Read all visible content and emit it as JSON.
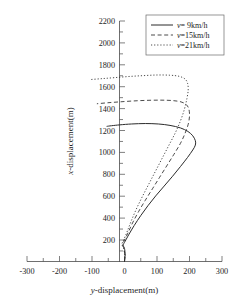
{
  "chart_data": {
    "type": "line",
    "title": "",
    "xlabel": "y-displacement(m)",
    "ylabel": "x-displacement(m)",
    "xlim": [
      -300,
      300
    ],
    "ylim": [
      0,
      2200
    ],
    "xticks": [
      -300,
      -200,
      -100,
      0,
      100,
      200,
      300
    ],
    "yticks": [
      200,
      400,
      600,
      800,
      1000,
      1200,
      1400,
      1600,
      1800,
      2000,
      2200
    ],
    "xtick_labels": [
      "-300",
      "-200",
      "-100",
      "0",
      "100",
      "200",
      "300"
    ],
    "ytick_labels": [
      "200",
      "400",
      "600",
      "800",
      "1000",
      "1200",
      "1400",
      "1600",
      "1800",
      "2000",
      "2200"
    ],
    "x_minor_tick_step": 50,
    "y_minor_tick_step": 100,
    "grid": false,
    "legend_position": "top-right",
    "series": [
      {
        "name": "v= 9km/h",
        "style": "solid",
        "color": "#2b2b2b",
        "peak_x_displacement": 1260,
        "max_y_displacement": 218,
        "min_y_displacement": -55,
        "points": [
          [
            0,
            0
          ],
          [
            2,
            60
          ],
          [
            0,
            120
          ],
          [
            -4,
            150
          ],
          [
            2,
            185
          ],
          [
            14,
            250
          ],
          [
            30,
            330
          ],
          [
            50,
            420
          ],
          [
            72,
            510
          ],
          [
            96,
            600
          ],
          [
            122,
            690
          ],
          [
            148,
            780
          ],
          [
            172,
            868
          ],
          [
            194,
            952
          ],
          [
            210,
            1020
          ],
          [
            218,
            1065
          ],
          [
            218,
            1105
          ],
          [
            210,
            1150
          ],
          [
            195,
            1190
          ],
          [
            172,
            1222
          ],
          [
            140,
            1245
          ],
          [
            104,
            1258
          ],
          [
            64,
            1262
          ],
          [
            22,
            1258
          ],
          [
            -14,
            1250
          ],
          [
            -40,
            1242
          ],
          [
            -55,
            1236
          ]
        ]
      },
      {
        "name": "v=15km/h",
        "style": "dashed",
        "color": "#2b2b2b",
        "peak_x_displacement": 1470,
        "max_y_displacement": 200,
        "min_y_displacement": -85,
        "points": [
          [
            0,
            0
          ],
          [
            1,
            60
          ],
          [
            -2,
            120
          ],
          [
            -6,
            155
          ],
          [
            0,
            195
          ],
          [
            12,
            270
          ],
          [
            26,
            360
          ],
          [
            44,
            460
          ],
          [
            64,
            560
          ],
          [
            86,
            665
          ],
          [
            108,
            770
          ],
          [
            130,
            875
          ],
          [
            152,
            980
          ],
          [
            172,
            1080
          ],
          [
            186,
            1170
          ],
          [
            196,
            1255
          ],
          [
            200,
            1330
          ],
          [
            198,
            1395
          ],
          [
            190,
            1435
          ],
          [
            174,
            1460
          ],
          [
            148,
            1472
          ],
          [
            112,
            1476
          ],
          [
            68,
            1474
          ],
          [
            24,
            1468
          ],
          [
            -16,
            1460
          ],
          [
            -52,
            1452
          ],
          [
            -85,
            1443
          ]
        ]
      },
      {
        "name": "v=21km/h",
        "style": "dotted",
        "color": "#2b2b2b",
        "peak_x_displacement": 1700,
        "max_y_displacement": 196,
        "min_y_displacement": -103,
        "points": [
          [
            0,
            0
          ],
          [
            1,
            60
          ],
          [
            -3,
            122
          ],
          [
            -8,
            158
          ],
          [
            -2,
            200
          ],
          [
            9,
            280
          ],
          [
            22,
            380
          ],
          [
            38,
            490
          ],
          [
            56,
            600
          ],
          [
            76,
            715
          ],
          [
            96,
            830
          ],
          [
            116,
            945
          ],
          [
            136,
            1060
          ],
          [
            156,
            1175
          ],
          [
            172,
            1285
          ],
          [
            184,
            1390
          ],
          [
            192,
            1490
          ],
          [
            196,
            1570
          ],
          [
            194,
            1630
          ],
          [
            186,
            1670
          ],
          [
            168,
            1694
          ],
          [
            140,
            1704
          ],
          [
            100,
            1706
          ],
          [
            56,
            1700
          ],
          [
            12,
            1692
          ],
          [
            -30,
            1682
          ],
          [
            -68,
            1673
          ],
          [
            -103,
            1665
          ]
        ]
      }
    ],
    "legend_entries": [
      {
        "label": "v= 9km/h",
        "velocity_symbol": "v",
        "velocity_value": "= 9km/h",
        "style": "solid"
      },
      {
        "label": "v=15km/h",
        "velocity_symbol": "v",
        "velocity_value": "=15km/h",
        "style": "dashed"
      },
      {
        "label": "v=21km/h",
        "velocity_symbol": "v",
        "velocity_value": "=21km/h",
        "style": "dotted"
      }
    ]
  },
  "axis_titles": {
    "x_symbol": "y",
    "x_rest": "-displacement(m)",
    "y_symbol": "x",
    "y_rest": "-displacement(m)"
  }
}
